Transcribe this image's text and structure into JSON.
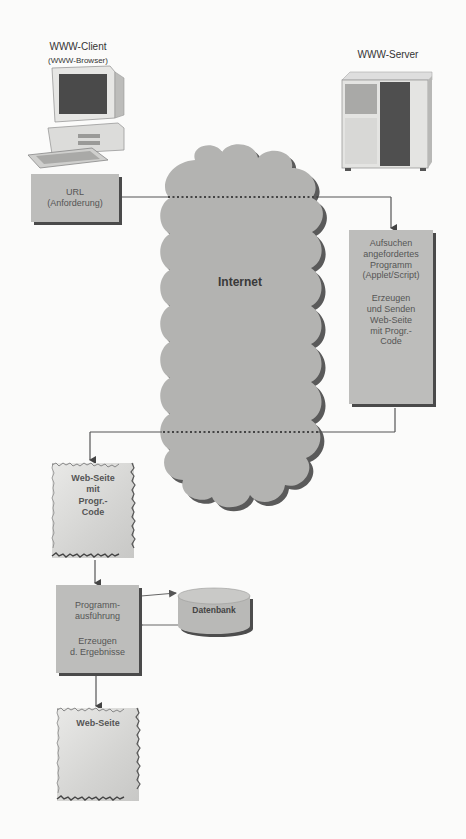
{
  "diagram": {
    "client": {
      "title": "WWW-Client",
      "subtitle": "(WWW-Browser)",
      "icon": "desktop-computer-icon"
    },
    "server": {
      "title": "WWW-Server",
      "icon": "server-tower-icon"
    },
    "url_box": {
      "line1": "URL",
      "line2": "(Anforderung)"
    },
    "cloud": {
      "label": "Internet"
    },
    "server_box": {
      "lines_a": [
        "Aufsuchen",
        "angefordertes",
        "Programm",
        "(Applet/Script)"
      ],
      "lines_b": [
        "Erzeugen",
        "und Senden",
        "Web-Seite",
        "mit Progr.-",
        "Code"
      ]
    },
    "webpage_with_code": {
      "lines": [
        "Web-Seite",
        "mit",
        "Progr.-",
        "Code"
      ]
    },
    "execution_box": {
      "lines_a": [
        "Programm-",
        "ausführung"
      ],
      "lines_b": [
        "Erzeugen",
        "d. Ergebnisse"
      ]
    },
    "database": {
      "label": "Datenbank"
    },
    "webpage_result": {
      "label": "Web-Seite"
    },
    "colors": {
      "box_fill": "#bdbdbb",
      "cloud_fill": "#b3b3b1",
      "shadow": "#4a4a4a",
      "line": "#555555",
      "background": "#fbfbfa"
    }
  }
}
